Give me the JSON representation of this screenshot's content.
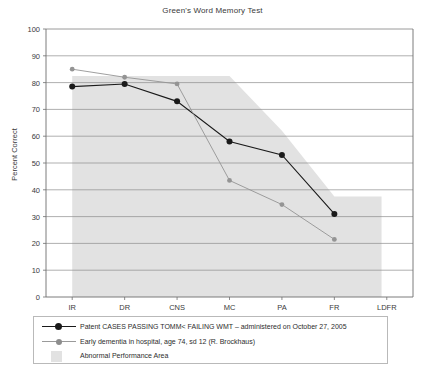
{
  "chart_data": {
    "type": "line",
    "title": "Green's Word Memory Test",
    "xlabel": "",
    "ylabel": "Percent Correct",
    "categories": [
      "IR",
      "DR",
      "CNS",
      "MC",
      "PA",
      "FR",
      "LDFR"
    ],
    "ylim": [
      0,
      100
    ],
    "yticks": [
      0,
      10,
      20,
      30,
      40,
      50,
      60,
      70,
      80,
      90,
      100
    ],
    "grid": true,
    "legend_position": "below-axes",
    "series": [
      {
        "name": "Patent CASES PASSING TOMM< FAILING WMT – administered on October 27, 2005",
        "color": "#1a1a1a",
        "marker": "circle",
        "values": [
          78.5,
          79.5,
          73,
          58,
          53,
          31,
          null
        ]
      },
      {
        "name": "Early dementia in hospital, age 74, sd 12 (R. Brockhaus)",
        "color": "#949494",
        "marker": "circle-small",
        "values": [
          85,
          82,
          79.5,
          43.5,
          34.5,
          21.5,
          null
        ]
      }
    ],
    "shaded_region": {
      "name": "Abnormal Performance Area",
      "color": "#e2e2e2",
      "upper_bound": [
        82.5,
        82.5,
        82.5,
        82.5,
        62,
        37.5,
        37.5
      ],
      "lower_bound": 0
    },
    "annotations": []
  },
  "legend": {
    "items": [
      {
        "label": "Patent CASES PASSING TOMM< FAILING WMT – administered on October 27, 2005",
        "key": "line-marker-black"
      },
      {
        "label": "Early dementia in hospital, age 74, sd 12 (R. Brockhaus)",
        "key": "line-marker-gray"
      },
      {
        "label": "Abnormal Performance Area",
        "key": "area-swatch-gray"
      }
    ]
  },
  "colors": {
    "series_1": "#1a1a1a",
    "series_2": "#949494",
    "shaded_area": "#e2e2e2",
    "grid": "#8e8e8e",
    "axis": "#6e6e6e",
    "text": "#2a2a2a",
    "background": "#ffffff"
  }
}
